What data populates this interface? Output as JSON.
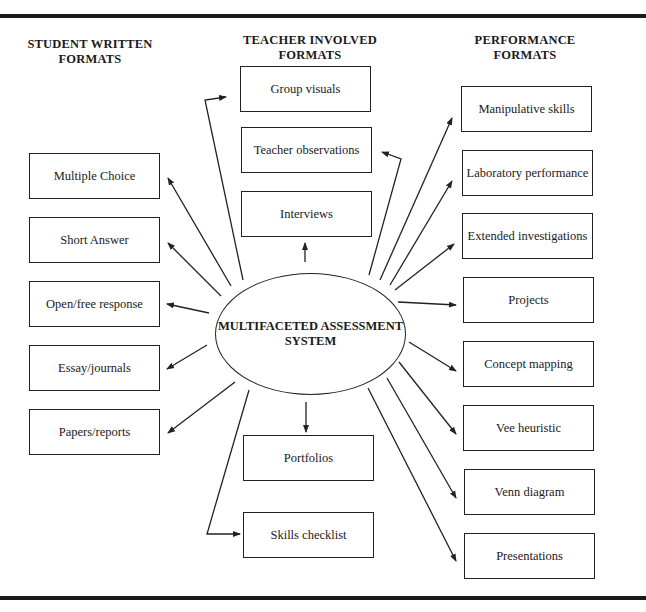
{
  "columns": {
    "student_written": {
      "heading_line1": "STUDENT WRITTEN",
      "heading_line2": "FORMATS"
    },
    "teacher_involved": {
      "heading_line1": "TEACHER INVOLVED",
      "heading_line2": "FORMATS"
    },
    "performance": {
      "heading_line1": "PERFORMANCE",
      "heading_line2": "FORMATS"
    }
  },
  "center": {
    "line1": "MULTIFACETED ASSESSMENT",
    "line2": "SYSTEM"
  },
  "student_written_items": [
    "Multiple Choice",
    "Short Answer",
    "Open/free response",
    "Essay/journals",
    "Papers/reports"
  ],
  "teacher_involved_items": {
    "top": [
      "Group visuals",
      "Teacher observations",
      "Interviews"
    ],
    "bottom": [
      "Portfolios",
      "Skills checklist"
    ]
  },
  "performance_items": [
    "Manipulative skills",
    "Laboratory performance",
    "Extended investigations",
    "Projects",
    "Concept mapping",
    "Vee heuristic",
    "Venn diagram",
    "Presentations"
  ]
}
